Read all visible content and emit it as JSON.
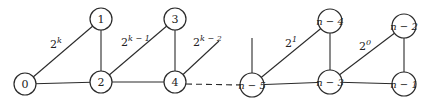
{
  "diagram": {
    "type": "graph",
    "nodes": [
      {
        "id": "0",
        "label": "0",
        "x": 25,
        "y": 84
      },
      {
        "id": "1",
        "label": "1",
        "x": 101,
        "y": 19
      },
      {
        "id": "2",
        "label": "2",
        "x": 101,
        "y": 82
      },
      {
        "id": "3",
        "label": "3",
        "x": 175,
        "y": 19
      },
      {
        "id": "4",
        "label": "4",
        "x": 175,
        "y": 82
      },
      {
        "id": "n-5",
        "label": "n − 5",
        "x": 252,
        "y": 85
      },
      {
        "id": "n-4",
        "label": "n − 4",
        "x": 330,
        "y": 21
      },
      {
        "id": "n-3",
        "label": "n − 3",
        "x": 330,
        "y": 82
      },
      {
        "id": "n-2",
        "label": "n − 2",
        "x": 404,
        "y": 26
      },
      {
        "id": "n-1",
        "label": "n − 1",
        "x": 404,
        "y": 84
      }
    ],
    "weights": {
      "w0": {
        "base": "2",
        "exp": "k"
      },
      "w1": {
        "base": "2",
        "exp": "k − 1"
      },
      "w2": {
        "base": "2",
        "exp": "k − 2"
      },
      "w3": {
        "base": "2",
        "exp": "1"
      },
      "w4": {
        "base": "2",
        "exp": "0"
      }
    }
  }
}
